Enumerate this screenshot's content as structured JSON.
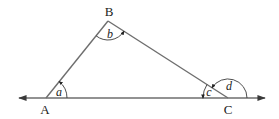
{
  "diagram": {
    "type": "triangle-angles",
    "colors": {
      "line": "#6e6e6e",
      "arc": "#3a3a3a",
      "text": "#222222",
      "background": "#ffffff"
    },
    "vertices": {
      "A": {
        "label": "A",
        "x": 46,
        "y": 98
      },
      "B": {
        "label": "B",
        "x": 108,
        "y": 21
      },
      "C": {
        "label": "C",
        "x": 228,
        "y": 98
      }
    },
    "baseline": {
      "x1": 18,
      "x2": 266,
      "y": 98,
      "arrows": "both"
    },
    "angles": {
      "a": {
        "label": "a",
        "vertex": "A",
        "kind": "interior"
      },
      "b": {
        "label": "b",
        "vertex": "B",
        "kind": "interior"
      },
      "c": {
        "label": "c",
        "vertex": "C",
        "kind": "interior"
      },
      "d": {
        "label": "d",
        "vertex": "C",
        "kind": "exterior"
      }
    }
  }
}
